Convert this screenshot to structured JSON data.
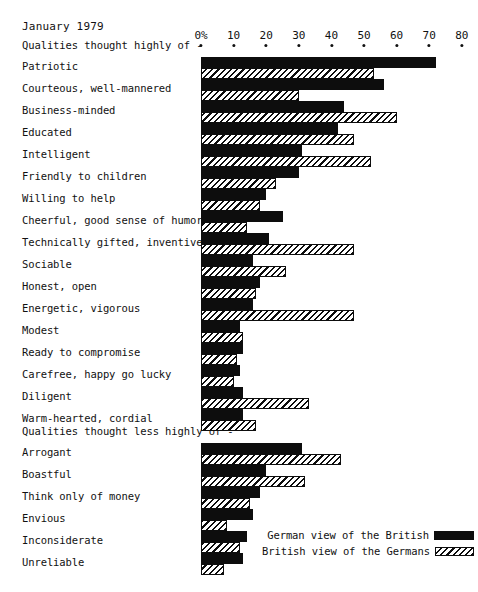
{
  "header": {
    "date": "January 1979"
  },
  "legend": {
    "series": [
      {
        "name": "German view of the British",
        "style": "black"
      },
      {
        "name": "British view of the Germans",
        "style": "hatch"
      }
    ]
  },
  "sections": [
    {
      "title": "Qualities thought highly of -"
    },
    {
      "title": "Qualities thought less highly of -"
    }
  ],
  "chart_data": {
    "type": "bar",
    "orientation": "horizontal",
    "title": "January 1979",
    "xlabel": "",
    "ylabel": "",
    "xlim": [
      0,
      80
    ],
    "grid": false,
    "legend_position": "bottom-right",
    "tick_labels": [
      "0%",
      "10",
      "20",
      "30",
      "40",
      "50",
      "60",
      "70",
      "80"
    ],
    "ticks": [
      0,
      10,
      20,
      30,
      40,
      50,
      60,
      70,
      80
    ],
    "series": [
      {
        "name": "German view of the British",
        "style": "black"
      },
      {
        "name": "British view of the Germans",
        "style": "hatch"
      }
    ],
    "groups": [
      {
        "title": "Qualities thought highly of -",
        "categories": [
          "Patriotic",
          "Courteous, well-mannered",
          "Business-minded",
          "Educated",
          "Intelligent",
          "Friendly to children",
          "Willing to help",
          "Cheerful, good sense of humor",
          "Technically gifted, inventive",
          "Sociable",
          "Honest, open",
          "Energetic, vigorous",
          "Modest",
          "Ready to compromise",
          "Carefree, happy go lucky",
          "Diligent",
          "Warm-hearted, cordial"
        ],
        "german_view_of_british": [
          72,
          56,
          44,
          42,
          31,
          30,
          20,
          25,
          21,
          16,
          18,
          16,
          12,
          13,
          12,
          13,
          13
        ],
        "british_view_of_germans": [
          53,
          30,
          60,
          47,
          52,
          23,
          18,
          14,
          47,
          26,
          17,
          47,
          13,
          11,
          10,
          33,
          17
        ]
      },
      {
        "title": "Qualities thought less highly of -",
        "categories": [
          "Arrogant",
          "Boastful",
          "Think only of money",
          "Envious",
          "Inconsiderate",
          "Unreliable"
        ],
        "german_view_of_british": [
          31,
          20,
          18,
          16,
          14,
          13
        ],
        "british_view_of_germans": [
          43,
          32,
          15,
          8,
          12,
          7
        ]
      }
    ]
  }
}
